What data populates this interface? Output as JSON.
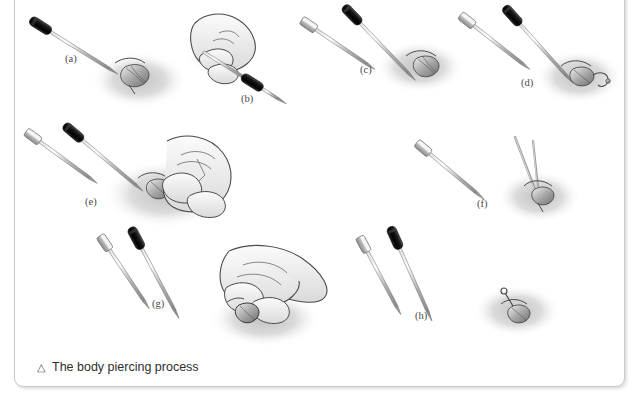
{
  "page": {
    "top_text": "y,     g                              ...ends before pulling it through the piercing where it is secured.",
    "top_text_visible": "pulling it through the piercing where it is secured."
  },
  "figure": {
    "caption_marker": "△",
    "caption": "The body piercing process",
    "border_color": "#c9c9c9",
    "background": "#ffffff",
    "shadow_ellipse_color": "#c8c8c8",
    "needle_metal_color": "#b8b8b8",
    "needle_grip_color": "#1f1f1f",
    "outline_color": "#4a4a4a",
    "panels": [
      {
        "id": "a",
        "label": "(a)",
        "x": 50,
        "y": 64,
        "desc": "cannula needle with dark grip positioned at navel"
      },
      {
        "id": "b",
        "label": "(b)",
        "x": 226,
        "y": 104,
        "desc": "hand gripping the needle"
      },
      {
        "id": "c",
        "label": "(c)",
        "x": 345,
        "y": 75,
        "desc": "two instruments aligned over navel"
      },
      {
        "id": "d",
        "label": "(d)",
        "x": 506,
        "y": 88,
        "desc": "jewelry bar attached at navel"
      },
      {
        "id": "e",
        "label": "(e)",
        "x": 70,
        "y": 207,
        "desc": "hands guiding instruments through piercing"
      },
      {
        "id": "f",
        "label": "(f)",
        "x": 462,
        "y": 209,
        "desc": "rod passing through the piercing"
      },
      {
        "id": "g",
        "label": "(g)",
        "x": 137,
        "y": 309,
        "desc": "two parallel instruments"
      },
      {
        "id": "h",
        "label": "(h)",
        "x": 400,
        "y": 321,
        "desc": "final jewelry fitted in piercing"
      }
    ],
    "illustrations": [
      {
        "name": "hand-illustration-b",
        "panel": "b"
      },
      {
        "name": "hand-illustration-e",
        "panel": "e"
      },
      {
        "name": "hand-illustration-bottom",
        "panel": "g"
      }
    ]
  }
}
